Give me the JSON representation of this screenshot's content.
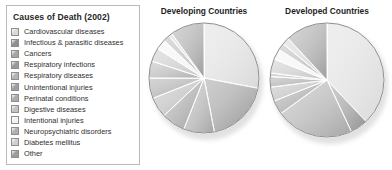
{
  "legend": {
    "title": "Causes of Death (2002)",
    "items": [
      {
        "label": "Cardiovascular diseases",
        "color": "#d9d9d9"
      },
      {
        "label": "Infectious & parasitic diseases",
        "color": "#8f8f8f"
      },
      {
        "label": "Cancers",
        "color": "#a5a5a5"
      },
      {
        "label": "Respiratory infections",
        "color": "#9a9a9a"
      },
      {
        "label": "Respiratory diseases",
        "color": "#b4b4b4"
      },
      {
        "label": "Unintentional injuries",
        "color": "#9e9e9e"
      },
      {
        "label": "Perinatal conditions",
        "color": "#ababab"
      },
      {
        "label": "Digestive diseases",
        "color": "#c2c2c2"
      },
      {
        "label": "Intentional injuries",
        "color": "#f2f2f2"
      },
      {
        "label": "Neuropsychiatric disorders",
        "color": "#b0b0b0"
      },
      {
        "label": "Diabetes mellitus",
        "color": "#cfcfcf"
      },
      {
        "label": "Other",
        "color": "#9c9c9c"
      }
    ]
  },
  "chart_data": [
    {
      "type": "pie",
      "title": "Developing Countries",
      "categories": [
        "Cardiovascular diseases",
        "Infectious & parasitic diseases",
        "Cancers",
        "Respiratory infections",
        "Respiratory diseases",
        "Unintentional injuries",
        "Perinatal conditions",
        "Digestive diseases",
        "Intentional injuries",
        "Neuropsychiatric disorders",
        "Diabetes mellitus",
        "Other"
      ],
      "values": [
        28,
        19,
        9,
        7,
        6,
        6,
        5,
        4,
        3,
        2,
        1,
        10
      ],
      "colors": [
        "#d9d9d9",
        "#8f8f8f",
        "#a5a5a5",
        "#9a9a9a",
        "#b4b4b4",
        "#9e9e9e",
        "#ababab",
        "#c2c2c2",
        "#f2f2f2",
        "#b0b0b0",
        "#cfcfcf",
        "#9c9c9c"
      ],
      "start_angle": 0,
      "legend_position": "left",
      "grid": false
    },
    {
      "type": "pie",
      "title": "Developed Countries",
      "categories": [
        "Cardiovascular diseases",
        "Infectious & parasitic diseases",
        "Cancers",
        "Respiratory infections",
        "Respiratory diseases",
        "Unintentional injuries",
        "Perinatal conditions",
        "Digestive diseases",
        "Intentional injuries",
        "Neuropsychiatric disorders",
        "Diabetes mellitus",
        "Other"
      ],
      "values": [
        38,
        5,
        22,
        4,
        4,
        3,
        1,
        4,
        3,
        2,
        2,
        12
      ],
      "colors": [
        "#d9d9d9",
        "#8f8f8f",
        "#a5a5a5",
        "#9a9a9a",
        "#b4b4b4",
        "#9e9e9e",
        "#ababab",
        "#c2c2c2",
        "#f2f2f2",
        "#b0b0b0",
        "#cfcfcf",
        "#9c9c9c"
      ],
      "start_angle": 0,
      "legend_position": "left",
      "grid": false
    }
  ]
}
